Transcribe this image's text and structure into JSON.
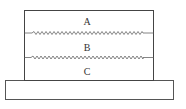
{
  "diagram": {
    "layers": [
      {
        "id": "A",
        "label": "A"
      },
      {
        "id": "B",
        "label": "B"
      },
      {
        "id": "C",
        "label": "C"
      }
    ],
    "interfaces": [
      {
        "between": [
          "A",
          "B"
        ],
        "type": "rough"
      },
      {
        "between": [
          "B",
          "C"
        ],
        "type": "rough"
      }
    ],
    "base": {
      "label": ""
    },
    "colors": {
      "stroke": "#555555",
      "background": "#ffffff"
    }
  }
}
